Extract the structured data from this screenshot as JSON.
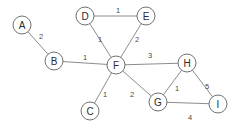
{
  "graph": {
    "title": "weighted-undirected-graph",
    "style": {
      "background": "#ffffff",
      "node_fill": "#ffffff",
      "node_stroke": "#707070",
      "node_radius": 9,
      "edge_stroke": "#8c8c8c",
      "label_color": "#2b2b2b",
      "weight_color": "#4a4a4a"
    },
    "nodes": [
      {
        "id": "A",
        "label": "A",
        "x": 22,
        "y": 25
      },
      {
        "id": "B",
        "label": "B",
        "x": 54,
        "y": 61
      },
      {
        "id": "C",
        "label": "C",
        "x": 90,
        "y": 111
      },
      {
        "id": "D",
        "label": "D",
        "x": 85,
        "y": 16
      },
      {
        "id": "E",
        "label": "E",
        "x": 146,
        "y": 16
      },
      {
        "id": "F",
        "label": "F",
        "x": 116,
        "y": 65
      },
      {
        "id": "G",
        "label": "G",
        "x": 158,
        "y": 102
      },
      {
        "id": "H",
        "label": "H",
        "x": 187,
        "y": 63
      },
      {
        "id": "I",
        "label": "I",
        "x": 218,
        "y": 104
      }
    ],
    "edges": [
      {
        "id": "A-B",
        "source": "A",
        "target": "B",
        "weight": "2",
        "lx": 41,
        "ly": 36
      },
      {
        "id": "B-F",
        "source": "B",
        "target": "F",
        "weight": "1",
        "lx": 85,
        "ly": 57
      },
      {
        "id": "D-E",
        "source": "D",
        "target": "E",
        "weight": "1",
        "lx": 118,
        "ly": 10
      },
      {
        "id": "D-F",
        "source": "D",
        "target": "F",
        "weight": "1",
        "lx": 100,
        "ly": 39
      },
      {
        "id": "E-F",
        "source": "E",
        "target": "F",
        "weight": "2",
        "lx": 137,
        "ly": 39
      },
      {
        "id": "F-H",
        "source": "F",
        "target": "H",
        "weight": "3",
        "lx": 150,
        "ly": 55
      },
      {
        "id": "C-F",
        "source": "C",
        "target": "F",
        "weight": "1",
        "lx": 105,
        "ly": 94
      },
      {
        "id": "F-G",
        "source": "F",
        "target": "G",
        "weight": "2",
        "lx": 132,
        "ly": 94
      },
      {
        "id": "G-H",
        "source": "G",
        "target": "H",
        "weight": "1",
        "lx": 177,
        "ly": 88
      },
      {
        "id": "H-I",
        "source": "H",
        "target": "I",
        "weight": "5",
        "lx": 207,
        "ly": 86
      },
      {
        "id": "G-I",
        "source": "G",
        "target": "I",
        "weight": "4",
        "lx": 190,
        "ly": 117
      }
    ]
  }
}
